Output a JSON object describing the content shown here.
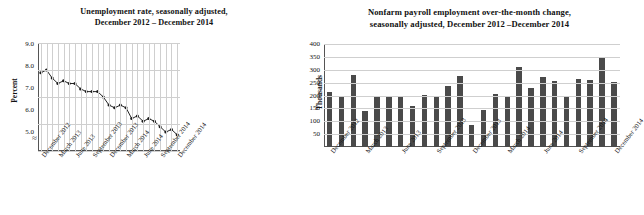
{
  "left": {
    "title_line1": "Unemployment rate, seasonally adjusted,",
    "title_line2": "December 2012 – December 2014",
    "ylabel": "Percent",
    "yticks": [
      "9.0",
      "8.0",
      "7.0",
      "6.0",
      "5.0"
    ],
    "xlabels": [
      "December 2012",
      "March 2013",
      "June 2013",
      "September 2013",
      "December 2013",
      "March 2014",
      "June 2014",
      "September 2014",
      "December 2014"
    ],
    "axis_break": "≈"
  },
  "right": {
    "title_line1": "Nonfarm payroll employment over-the-month change,",
    "title_line2": "seasonally adjusted, December 2012 –December 2014",
    "ylabel": "Thousands",
    "yticks": [
      "400",
      "350",
      "300",
      "250",
      "200",
      "150",
      "100",
      "50"
    ],
    "xlabels": [
      "December 2012",
      "March 2013",
      "June 2013",
      "September 2013",
      "December 2013",
      "March 2014",
      "June 2014",
      "September 2014",
      "December 2014"
    ]
  },
  "chart_data": [
    {
      "type": "line",
      "title": "Unemployment rate, seasonally adjusted, December 2012 – December 2014",
      "xlabel": "",
      "ylabel": "Percent",
      "ylim": [
        5.0,
        9.0
      ],
      "grid": true,
      "legend": "none",
      "x": [
        "Dec 2012",
        "Jan 2013",
        "Feb 2013",
        "Mar 2013",
        "Apr 2013",
        "May 2013",
        "Jun 2013",
        "Jul 2013",
        "Aug 2013",
        "Sep 2013",
        "Oct 2013",
        "Nov 2013",
        "Dec 2013",
        "Jan 2014",
        "Feb 2014",
        "Mar 2014",
        "Apr 2014",
        "May 2014",
        "Jun 2014",
        "Jul 2014",
        "Aug 2014",
        "Sep 2014",
        "Oct 2014",
        "Nov 2014",
        "Dec 2014"
      ],
      "values": [
        7.9,
        8.0,
        7.7,
        7.5,
        7.6,
        7.5,
        7.5,
        7.3,
        7.2,
        7.2,
        7.2,
        7.0,
        6.7,
        6.6,
        6.7,
        6.6,
        6.2,
        6.3,
        6.1,
        6.2,
        6.1,
        5.9,
        5.7,
        5.8,
        5.6
      ],
      "tick_positions": [
        0,
        3,
        6,
        9,
        12,
        15,
        18,
        21,
        24
      ],
      "tick_labels": [
        "December 2012",
        "March 2013",
        "June 2013",
        "September 2013",
        "December 2013",
        "March 2014",
        "June 2014",
        "September 2014",
        "December 2014"
      ]
    },
    {
      "type": "bar",
      "title": "Nonfarm payroll employment over-the-month change, seasonally adjusted, December 2012 –December 2014",
      "xlabel": "",
      "ylabel": "Thousands",
      "ylim": [
        0,
        400
      ],
      "grid": true,
      "legend": "none",
      "categories": [
        "Dec 2012",
        "Jan 2013",
        "Feb 2013",
        "Mar 2013",
        "Apr 2013",
        "May 2013",
        "Jun 2013",
        "Jul 2013",
        "Aug 2013",
        "Sep 2013",
        "Oct 2013",
        "Nov 2013",
        "Dec 2013",
        "Jan 2014",
        "Feb 2014",
        "Mar 2014",
        "Apr 2014",
        "May 2014",
        "Jun 2014",
        "Jul 2014",
        "Aug 2014",
        "Sep 2014",
        "Oct 2014",
        "Nov 2014",
        "Dec 2014"
      ],
      "values": [
        214,
        197,
        280,
        141,
        198,
        197,
        197,
        161,
        202,
        196,
        237,
        274,
        84,
        144,
        205,
        197,
        310,
        229,
        272,
        255,
        197,
        265,
        261,
        350,
        252
      ],
      "tick_positions": [
        0,
        3,
        6,
        9,
        12,
        15,
        18,
        21,
        24
      ],
      "tick_labels": [
        "December 2012",
        "March 2013",
        "June 2013",
        "September 2013",
        "December 2013",
        "March 2014",
        "June 2014",
        "September 2014",
        "December 2014"
      ]
    }
  ]
}
